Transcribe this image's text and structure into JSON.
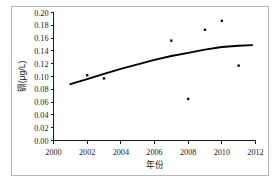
{
  "chart_data": {
    "type": "scatter",
    "title": "",
    "subtitle": "",
    "xlabel": "年份",
    "ylabel": "镉(μg/L)",
    "xlim": [
      2000,
      2012
    ],
    "ylim": [
      0.0,
      0.2
    ],
    "xticks": [
      2000,
      2002,
      2004,
      2006,
      2008,
      2010,
      2012
    ],
    "xtick_labels": [
      "2000",
      "2002",
      "2004",
      "2006",
      "2008",
      "2010",
      "2012"
    ],
    "yticks": [
      0.0,
      0.02,
      0.04,
      0.06,
      0.08,
      0.1,
      0.12,
      0.14,
      0.16,
      0.18,
      0.2
    ],
    "ytick_labels": [
      "0.00",
      "0.02",
      "0.04",
      "0.06",
      "0.08",
      "0.10",
      "0.12",
      "0.14",
      "0.16",
      "0.18",
      "0.20"
    ],
    "grid": false,
    "legend": false,
    "legend_position": "none",
    "marker": "square",
    "marker_color": "#101010",
    "line_color": "#000000",
    "series": [
      {
        "name": "镉观测值",
        "type": "scatter",
        "points": [
          {
            "x": 2002.0,
            "y": 0.102
          },
          {
            "x": 2003.0,
            "y": 0.097
          },
          {
            "x": 2007.0,
            "y": 0.156
          },
          {
            "x": 2008.0,
            "y": 0.065
          },
          {
            "x": 2009.0,
            "y": 0.173
          },
          {
            "x": 2010.0,
            "y": 0.187
          },
          {
            "x": 2011.0,
            "y": 0.117
          }
        ]
      },
      {
        "name": "趋势线",
        "type": "line",
        "points": [
          {
            "x": 2001.0,
            "y": 0.088
          },
          {
            "x": 2002.0,
            "y": 0.096
          },
          {
            "x": 2003.0,
            "y": 0.104
          },
          {
            "x": 2004.0,
            "y": 0.112
          },
          {
            "x": 2005.0,
            "y": 0.119
          },
          {
            "x": 2006.0,
            "y": 0.126
          },
          {
            "x": 2007.0,
            "y": 0.132
          },
          {
            "x": 2008.0,
            "y": 0.137
          },
          {
            "x": 2009.0,
            "y": 0.142
          },
          {
            "x": 2010.0,
            "y": 0.146
          },
          {
            "x": 2011.0,
            "y": 0.148
          },
          {
            "x": 2011.8,
            "y": 0.149
          }
        ]
      }
    ]
  }
}
